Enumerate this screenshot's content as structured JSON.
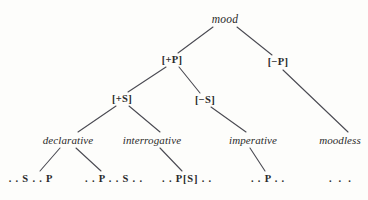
{
  "diagram": {
    "background_color": "#fdfdfb",
    "text_color": "#2a2a2a",
    "edge_color": "#4a4a52",
    "nodes": [
      {
        "id": "root",
        "label": "mood",
        "kind": "root",
        "x": 225,
        "y": 20
      },
      {
        "id": "plus-p",
        "label": "[+P]",
        "kind": "feature",
        "x": 172,
        "y": 60
      },
      {
        "id": "minus-p",
        "label": "[−P]",
        "kind": "feature",
        "x": 278,
        "y": 62
      },
      {
        "id": "plus-s",
        "label": "[+S]",
        "kind": "feature",
        "x": 122,
        "y": 99
      },
      {
        "id": "minus-s",
        "label": "[−S]",
        "kind": "feature",
        "x": 205,
        "y": 100
      },
      {
        "id": "declarative",
        "label": "declarative",
        "kind": "category",
        "x": 68,
        "y": 140
      },
      {
        "id": "interrogative",
        "label": "interrogative",
        "kind": "category",
        "x": 152,
        "y": 140
      },
      {
        "id": "imperative",
        "label": "imperative",
        "kind": "category",
        "x": 253,
        "y": 140
      },
      {
        "id": "moodless",
        "label": "moodless",
        "kind": "category",
        "x": 340,
        "y": 140
      },
      {
        "id": "leaf-sp",
        "label": ". . S . . P",
        "kind": "leaf",
        "x": 31,
        "y": 179
      },
      {
        "id": "leaf-ps",
        "label": ". . P . . S . .",
        "kind": "leaf",
        "x": 114,
        "y": 179
      },
      {
        "id": "leaf-pbs",
        "label": ". . P[S] . .",
        "kind": "leaf",
        "x": 187,
        "y": 179
      },
      {
        "id": "leaf-p",
        "label": ". . P . .",
        "kind": "leaf",
        "x": 268,
        "y": 179
      },
      {
        "id": "leaf-dots",
        "label": ". . .",
        "kind": "leaf",
        "x": 341,
        "y": 179
      }
    ],
    "edges": [
      {
        "id": "edge-root-plusp",
        "from": "root",
        "to": "plus-p",
        "x1": 213,
        "y1": 27,
        "x2": 178,
        "y2": 53
      },
      {
        "id": "edge-root-minusp",
        "from": "root",
        "to": "minus-p",
        "x1": 237,
        "y1": 27,
        "x2": 272,
        "y2": 55
      },
      {
        "id": "edge-plusp-pluss",
        "from": "plus-p",
        "to": "plus-s",
        "x1": 166,
        "y1": 67,
        "x2": 128,
        "y2": 92
      },
      {
        "id": "edge-plusp-minuss",
        "from": "plus-p",
        "to": "minus-s",
        "x1": 179,
        "y1": 67,
        "x2": 200,
        "y2": 93
      },
      {
        "id": "edge-pluss-declarative",
        "from": "plus-s",
        "to": "declarative",
        "x1": 116,
        "y1": 106,
        "x2": 78,
        "y2": 132
      },
      {
        "id": "edge-pluss-interrogative",
        "from": "plus-s",
        "to": "interrogative",
        "x1": 129,
        "y1": 106,
        "x2": 160,
        "y2": 132
      },
      {
        "id": "edge-minuss-imperative",
        "from": "minus-s",
        "to": "imperative",
        "x1": 211,
        "y1": 107,
        "x2": 246,
        "y2": 132
      },
      {
        "id": "edge-minusp-moodless",
        "from": "minus-p",
        "to": "moodless",
        "x1": 283,
        "y1": 70,
        "x2": 348,
        "y2": 132
      },
      {
        "id": "edge-declarative-leaf-sp",
        "from": "declarative",
        "to": "leaf-sp",
        "x1": 60,
        "y1": 148,
        "x2": 40,
        "y2": 171
      },
      {
        "id": "edge-declarative-leaf-ps",
        "from": "declarative",
        "to": "leaf-ps",
        "x1": 76,
        "y1": 148,
        "x2": 101,
        "y2": 171
      },
      {
        "id": "edge-interrogative-leaf-pbs",
        "from": "interrogative",
        "to": "leaf-pbs",
        "x1": 160,
        "y1": 148,
        "x2": 182,
        "y2": 171
      },
      {
        "id": "edge-imperative-leaf-p",
        "from": "imperative",
        "to": "leaf-p",
        "x1": 250,
        "y1": 148,
        "x2": 265,
        "y2": 171
      }
    ]
  }
}
